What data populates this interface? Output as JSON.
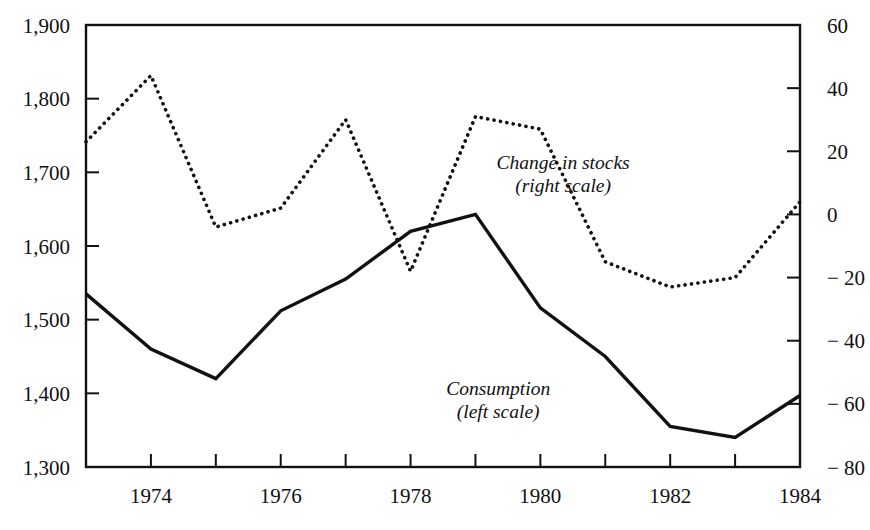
{
  "chart_data": {
    "type": "line",
    "title": "",
    "subtitle": "",
    "xlabel": "",
    "ylabel": "",
    "grid": false,
    "legend_position": "inline-annotations",
    "x": [
      1973,
      1974,
      1975,
      1976,
      1977,
      1978,
      1979,
      1980,
      1981,
      1982,
      1983,
      1984
    ],
    "xlim": [
      1973,
      1984
    ],
    "x_tick_values": [
      1973,
      1974,
      1975,
      1976,
      1977,
      1978,
      1979,
      1980,
      1981,
      1982,
      1983,
      1984
    ],
    "x_tick_labels": [
      "",
      "1974",
      "",
      "1976",
      "",
      "1978",
      "",
      "1980",
      "",
      "1982",
      "",
      "1984"
    ],
    "axes": [
      {
        "id": "left",
        "name": "left-scale",
        "ylim": [
          1300,
          1900
        ],
        "ticks": [
          1300,
          1400,
          1500,
          1600,
          1700,
          1800,
          1900
        ],
        "tick_labels": [
          "1,300",
          "1,400",
          "1,500",
          "1,600",
          "1,700",
          "1,800",
          "1,900"
        ]
      },
      {
        "id": "right",
        "name": "right-scale",
        "ylim": [
          -80,
          60
        ],
        "ticks": [
          -80,
          -60,
          -40,
          -20,
          0,
          20,
          40,
          60
        ],
        "tick_labels": [
          "− 80",
          "− 60",
          "− 40",
          "− 20",
          "0",
          "20",
          "40",
          "60"
        ]
      }
    ],
    "series": [
      {
        "name": "Consumption",
        "axis": "left",
        "style": "solid",
        "color": "#111111",
        "values": [
          1535,
          1460,
          1420,
          1512,
          1555,
          1620,
          1643,
          1516,
          1450,
          1355,
          1340,
          1397
        ]
      },
      {
        "name": "Change in stocks",
        "axis": "right",
        "style": "dotted",
        "color": "#111111",
        "values": [
          23,
          44,
          -4,
          2,
          30,
          -18,
          31,
          27,
          -15,
          -23,
          -20,
          4
        ]
      }
    ],
    "annotations": [
      {
        "id": "stocks",
        "line1": "Change in stocks",
        "line2": "(right scale)",
        "x": 1980.35,
        "y_axis": "right",
        "y": 14.5
      },
      {
        "id": "consumption",
        "line1": "Consumption",
        "line2": "(left scale)",
        "x": 1979.35,
        "y_axis": "left",
        "y": 1398
      }
    ]
  },
  "colors": {
    "ink": "#111111",
    "background": "#ffffff"
  }
}
